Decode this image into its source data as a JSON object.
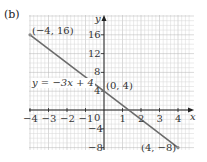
{
  "part_label": "(b)",
  "chart_data": {
    "type": "line",
    "title": "",
    "xlabel": "x",
    "ylabel": "y",
    "xlim": [
      -4,
      4.6
    ],
    "ylim": [
      -8.4,
      18.5
    ],
    "grid": true,
    "x_ticks": [
      -4,
      -3,
      -2,
      -1,
      0,
      1,
      2,
      3,
      4
    ],
    "x_tick_labels": [
      "−4",
      "−3",
      "−2",
      "−1",
      "0",
      "1",
      "2",
      "3",
      "4"
    ],
    "y_ticks": [
      -8,
      -4,
      4,
      8,
      12,
      16
    ],
    "y_tick_labels": [
      "−8",
      "−4",
      "4",
      "8",
      "12",
      "16"
    ],
    "series": [
      {
        "name": "y = −3x + 4",
        "x": [
          -4,
          0,
          4
        ],
        "y": [
          16,
          4,
          -8
        ],
        "color": "#6b6b6b"
      }
    ],
    "points": [
      {
        "x": -4,
        "y": 16,
        "label": "(−4, 16)"
      },
      {
        "x": 0,
        "y": 4,
        "label": "(0, 4)"
      },
      {
        "x": 4,
        "y": -8,
        "label": "(4, −8)"
      }
    ],
    "annotations": [
      "y = −3x + 4"
    ]
  },
  "colors": {
    "grid_minor": "#d6d6d6",
    "grid_major": "#b5b5b5",
    "axis": "#222222",
    "line": "#6b6b6b"
  }
}
